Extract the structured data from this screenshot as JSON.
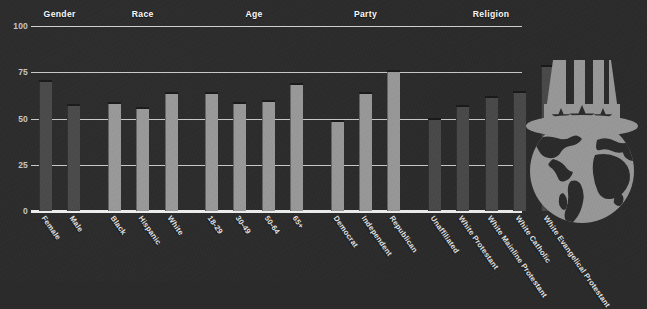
{
  "chart_data": {
    "type": "bar",
    "title": "",
    "subtitle": "",
    "xlabel": "",
    "ylabel": "",
    "ylim": [
      0,
      100
    ],
    "yticks": [
      0,
      25,
      50,
      75,
      100
    ],
    "grid": true,
    "legend": "none",
    "group_headers": [
      "Gender",
      "Race",
      "Age",
      "Party",
      "Religion"
    ],
    "groups": [
      {
        "name": "Gender",
        "shade": "dark",
        "categories": [
          "Female",
          "Male"
        ],
        "values": [
          70,
          57
        ]
      },
      {
        "name": "Race",
        "shade": "light",
        "categories": [
          "Black",
          "Hispanic",
          "White"
        ],
        "values": [
          58,
          55,
          63
        ]
      },
      {
        "name": "Age",
        "shade": "light",
        "categories": [
          "18-29",
          "30-49",
          "50-64",
          "65+"
        ],
        "values": [
          63,
          58,
          59,
          68
        ]
      },
      {
        "name": "Party",
        "shade": "light",
        "categories": [
          "Democrat",
          "Independent",
          "Republican"
        ],
        "values": [
          48,
          63,
          75
        ]
      },
      {
        "name": "Religion",
        "shade": "dark",
        "categories": [
          "Unaffiliated",
          "White Protestant",
          "White Mainline Protestant",
          "White Catholic",
          "White Evangelical Protestant"
        ],
        "values": [
          49,
          56,
          61,
          64,
          78
        ]
      }
    ],
    "categories": [
      "Female",
      "Male",
      "Black",
      "Hispanic",
      "White",
      "18-29",
      "30-49",
      "50-64",
      "65+",
      "Democrat",
      "Independent",
      "Republican",
      "Unaffiliated",
      "White Protestant",
      "White Mainline Protestant",
      "White Catholic",
      "White Evangelical Protestant"
    ],
    "values": [
      70,
      57,
      58,
      55,
      63,
      63,
      58,
      59,
      68,
      48,
      63,
      75,
      49,
      56,
      61,
      64,
      78
    ]
  },
  "colors": {
    "background": "#2b2b2b",
    "bar_dark": "#4a4a4a",
    "bar_light": "#9a9a9a",
    "gridline": "#d9d9d9",
    "axis_text": "#c9c9c9",
    "header_text": "#ffffff",
    "logo_fill": "#9a9a9a",
    "logo_detail": "#2b2b2b"
  },
  "logo": {
    "name": "uncle-sam-hat-globe-logo",
    "stars": 3,
    "stripes": 3
  }
}
